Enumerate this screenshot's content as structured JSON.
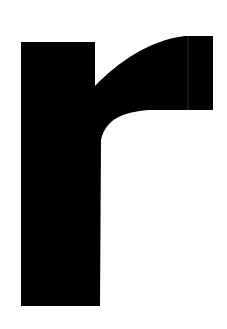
{
  "image": {
    "glyph": "r",
    "description": "Large black lowercase letter r on white background",
    "foreground": "#000000",
    "background": "#ffffff"
  }
}
